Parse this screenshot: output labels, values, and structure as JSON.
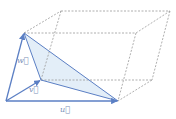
{
  "colors": {
    "vector": "#5b7fc4",
    "face_fill": "#e3eef8",
    "dashed": "#9a9a9a",
    "label": "#7a8fb8"
  },
  "vectors": [
    {
      "name": "u",
      "label": "u⃗"
    },
    {
      "name": "v",
      "label": "v⃗"
    },
    {
      "name": "w",
      "label": "w⃗"
    }
  ],
  "labels": {
    "u": "u⃗",
    "v": "v⃗",
    "w": "w⃗"
  }
}
